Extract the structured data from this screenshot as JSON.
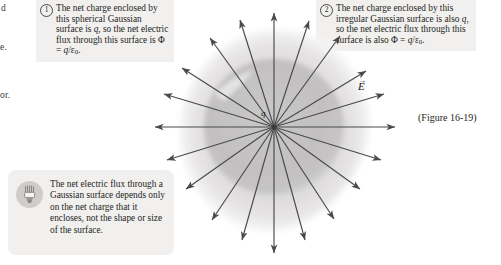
{
  "page": {
    "figure_reference": "(Figure 16-19)",
    "margin_fragments": [
      "d",
      "e.",
      "or."
    ]
  },
  "callouts": [
    {
      "number": "1",
      "badge_name": "callout-badge-1",
      "text": "The net charge enclosed by this spherical Gaussian surface is q, so the net electric flux through this surface is Φ = q/ε0."
    },
    {
      "number": "2",
      "badge_name": "callout-badge-2",
      "text": "The net charge enclosed by this irregular Gaussian surface is also q, so the net electric flux through this surface is also Φ = q/ε0."
    }
  ],
  "tip": {
    "icon": "lightbulb-icon",
    "text": "The net electric flux through a Gaussian surface depends only on the net charge that it encloses, not the shape or size of the surface."
  },
  "diagram": {
    "charge_label": "q",
    "field_label": "E",
    "field_label_accent": "→",
    "spherical_surface_name": "spherical-gaussian-surface",
    "irregular_surface_name": "irregular-gaussian-surface",
    "field_line_count": 20,
    "colors": {
      "inner_sphere": "#c3c1c1",
      "outer_blob": "#dcdada",
      "arrow": "#4a4a4a",
      "callout_bg": "#f1f0ef",
      "bulb_circle": "#cfcccb",
      "text": "#231f20"
    }
  }
}
